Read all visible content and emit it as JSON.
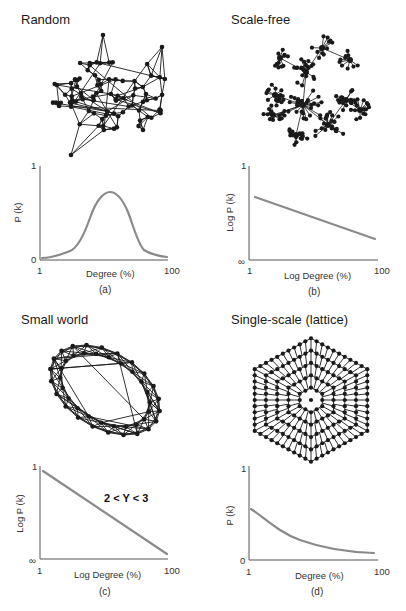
{
  "panels": [
    {
      "id": "a",
      "title": "Random",
      "caption": "(a)",
      "network_type": "random",
      "chart": {
        "ylabel": "P (k)",
        "xlabel": "Degree (%)",
        "y_top_tick": "1",
        "y_bottom_tick": "0",
        "x_left_tick": "1",
        "x_right_tick": "100"
      }
    },
    {
      "id": "b",
      "title": "Scale-free",
      "caption": "(b)",
      "network_type": "scale-free",
      "chart": {
        "ylabel": "Log P (k)",
        "xlabel": "Log Degree (%)",
        "y_top_tick": "1",
        "y_bottom_tick": "∞",
        "x_left_tick": "1",
        "x_right_tick": "100"
      }
    },
    {
      "id": "c",
      "title": "Small world",
      "caption": "(c)",
      "network_type": "small-world",
      "chart": {
        "ylabel": "Log P (k)",
        "xlabel": "Log Degree (%)",
        "y_top_tick": "1",
        "y_bottom_tick": "∞",
        "x_left_tick": "1",
        "x_right_tick": "100",
        "annotation": "2 < Y < 3"
      }
    },
    {
      "id": "d",
      "title": "Single-scale (lattice)",
      "caption": "(d)",
      "network_type": "lattice",
      "chart": {
        "ylabel": "P (k)",
        "xlabel": "Degree (%)",
        "y_top_tick": "1",
        "y_bottom_tick": "0",
        "x_left_tick": "1",
        "x_right_tick": "100"
      }
    }
  ],
  "colors": {
    "curve": "#8a8a8a",
    "axis": "#555555",
    "network": "#1a1a1a"
  },
  "chart_data": [
    {
      "type": "line",
      "title": "Random",
      "xlabel": "Degree (%)",
      "ylabel": "P (k)",
      "x_tick_labels": [
        "1",
        "100"
      ],
      "y_tick_labels": [
        "0",
        "1"
      ],
      "ylim": [
        0,
        1
      ],
      "shape": "bell (Poisson-like) curve peaking near middle",
      "x": [
        1,
        10,
        20,
        30,
        40,
        50,
        60,
        70,
        80,
        90,
        100
      ],
      "values": [
        0.02,
        0.05,
        0.1,
        0.35,
        0.65,
        0.72,
        0.6,
        0.3,
        0.1,
        0.05,
        0.02
      ]
    },
    {
      "type": "line",
      "title": "Scale-free",
      "xlabel": "Log Degree (%)",
      "ylabel": "Log P (k)",
      "x_tick_labels": [
        "1",
        "100"
      ],
      "y_tick_labels": [
        "∞",
        "1"
      ],
      "shape": "straight descending line (power law)",
      "x": [
        1,
        100
      ],
      "values": [
        0.68,
        0.22
      ]
    },
    {
      "type": "line",
      "title": "Small world",
      "xlabel": "Log Degree (%)",
      "ylabel": "Log P (k)",
      "x_tick_labels": [
        "1",
        "100"
      ],
      "y_tick_labels": [
        "∞",
        "1"
      ],
      "annotation": "2 < Y < 3",
      "shape": "straight descending line (power law)",
      "x": [
        1,
        100
      ],
      "values": [
        0.95,
        0.05
      ]
    },
    {
      "type": "line",
      "title": "Single-scale (lattice)",
      "xlabel": "Degree (%)",
      "ylabel": "P (k)",
      "x_tick_labels": [
        "1",
        "100"
      ],
      "y_tick_labels": [
        "0",
        "1"
      ],
      "ylim": [
        0,
        1
      ],
      "shape": "exponential decay",
      "x": [
        1,
        10,
        20,
        30,
        40,
        50,
        60,
        70,
        80,
        90,
        100
      ],
      "values": [
        0.55,
        0.42,
        0.32,
        0.24,
        0.18,
        0.14,
        0.11,
        0.09,
        0.08,
        0.07,
        0.07
      ]
    }
  ]
}
